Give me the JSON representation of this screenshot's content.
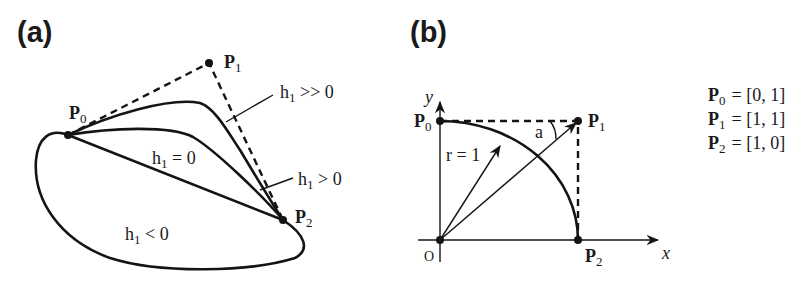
{
  "panel_a": {
    "label": "(a)",
    "points": {
      "p0": {
        "name": "P",
        "sub": "0"
      },
      "p1": {
        "name": "P",
        "sub": "1"
      },
      "p2": {
        "name": "P",
        "sub": "2"
      }
    },
    "curves": [
      {
        "id": "h1-much-greater",
        "h": "h",
        "sub": "1",
        "rel": " >> 0"
      },
      {
        "id": "h1-greater",
        "h": "h",
        "sub": "1",
        "rel": " > 0"
      },
      {
        "id": "h1-zero",
        "h": "h",
        "sub": "1",
        "rel": " = 0"
      },
      {
        "id": "h1-negative",
        "h": "h",
        "sub": "1",
        "rel": " < 0"
      }
    ]
  },
  "panel_b": {
    "label": "(b)",
    "axes": {
      "x": "x",
      "y": "y",
      "origin": "O"
    },
    "radius_label": "r = 1",
    "angle_label": "a",
    "points": {
      "p0": {
        "name": "P",
        "sub": "0"
      },
      "p1": {
        "name": "P",
        "sub": "1"
      },
      "p2": {
        "name": "P",
        "sub": "2"
      }
    },
    "legend": [
      {
        "name": "P",
        "sub": "0",
        "value": "= [0, 1]"
      },
      {
        "name": "P",
        "sub": "1",
        "value": "= [1, 1]"
      },
      {
        "name": "P",
        "sub": "2",
        "value": "= [1, 0]"
      }
    ]
  }
}
